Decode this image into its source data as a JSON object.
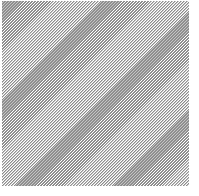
{
  "image": {
    "width": 199,
    "height": 196,
    "background_color": "#ffffff",
    "description": "Diagonally hatched gray rectangle on a white background"
  },
  "shape": {
    "name": "hatched-rectangle",
    "kind": "rectangle",
    "x": 2,
    "y": 1,
    "width": 187,
    "height": 185,
    "fill_style": "diagonal-hatch",
    "hatch_direction": "backslash",
    "hatch_angle_degrees": 135,
    "hatch_period_px": 3,
    "hatch_line_color": "#8c8c8c",
    "hatch_gap_color": "#ffffff",
    "border": "none",
    "label": ""
  },
  "margins": {
    "left_px": 2,
    "top_px": 1,
    "right_px": 10,
    "bottom_px": 10
  },
  "accessibility": {
    "alt_text": "A square region filled with a fine gray diagonal hatch pattern"
  }
}
